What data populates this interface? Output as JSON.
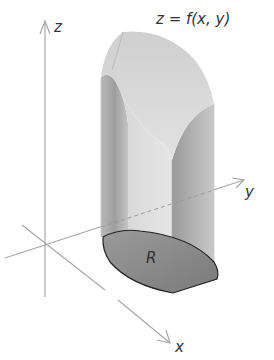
{
  "diagram": {
    "title_equation": "z = f(x, y)",
    "axes": {
      "x_label": "x",
      "y_label": "y",
      "z_label": "z"
    },
    "region_label": "R",
    "colors": {
      "axis": "#a8a8a8",
      "solid_light": "#dcdcdc",
      "solid_mid": "#bdbdbd",
      "solid_dark": "#9a9a9a",
      "region_fill": "#8c8c8c",
      "outline": "#222222",
      "text": "#333333"
    }
  }
}
